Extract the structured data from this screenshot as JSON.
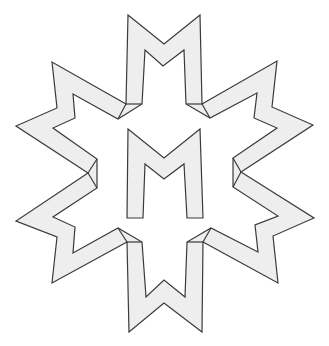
{
  "figure": {
    "colors": {
      "fill": "#eeeeee",
      "stroke": "#3a3a3a",
      "background": "#ffffff"
    },
    "center_letter": "M",
    "ring_letter_count": 6
  }
}
